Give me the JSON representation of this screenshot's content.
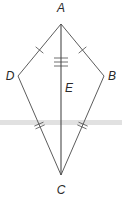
{
  "diagram": {
    "type": "kite",
    "colors": {
      "line": "#4a4a4a",
      "band": "#d4d4d4",
      "text": "#2a2a2a",
      "background": "#ffffff"
    },
    "vertices": {
      "A": {
        "label": "A",
        "x": 61,
        "y": 24,
        "lx": 61,
        "ly": 12
      },
      "B": {
        "label": "B",
        "x": 104,
        "y": 76,
        "lx": 112,
        "ly": 80
      },
      "C": {
        "label": "C",
        "x": 61,
        "y": 175,
        "lx": 61,
        "ly": 194
      },
      "D": {
        "label": "D",
        "x": 18,
        "y": 76,
        "lx": 10,
        "ly": 80
      },
      "E": {
        "label": "E",
        "x": 61,
        "y": 88,
        "lx": 69,
        "ly": 92
      }
    },
    "segments": [
      {
        "from": "A",
        "to": "D",
        "ticks": 1
      },
      {
        "from": "A",
        "to": "B",
        "ticks": 1
      },
      {
        "from": "D",
        "to": "C",
        "ticks": 2
      },
      {
        "from": "B",
        "to": "C",
        "ticks": 2
      },
      {
        "from": "A",
        "to": "C",
        "ticks": 3
      }
    ]
  }
}
